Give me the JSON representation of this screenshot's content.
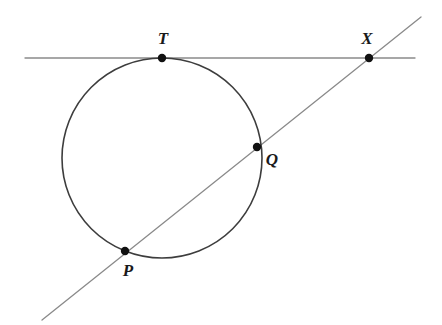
{
  "figure": {
    "width": 442,
    "height": 325,
    "background_color": "#ffffff"
  },
  "style": {
    "circle_stroke_color": "#3d3d3d",
    "circle_stroke_width": 1.6,
    "line_stroke_color": "#8a8a8a",
    "line_stroke_width": 1.3,
    "point_fill_color": "#111111",
    "point_radius": 4.2,
    "label_color": "#1a1a1a",
    "label_font_size": 17
  },
  "chart_data": {
    "type": "diagram",
    "shapes": {
      "circle": {
        "name": "circle",
        "center_x": 162,
        "center_y": 158,
        "radius": 100
      },
      "tangent_line": {
        "name": "tangent-line",
        "x1": 25,
        "y1": 58,
        "x2": 415,
        "y2": 58,
        "touches": "T"
      },
      "secant_line": {
        "name": "secant-line",
        "x1": 42,
        "y1": 320,
        "x2": 421,
        "y2": 17,
        "passes_through": "P, Q, X"
      }
    },
    "points": [
      {
        "label": "T",
        "x": 162,
        "y": 58,
        "label_x": 163,
        "label_y": 44,
        "role": "tangent-point"
      },
      {
        "label": "X",
        "x": 369,
        "y": 58,
        "label_x": 367,
        "label_y": 44,
        "role": "external-intersection"
      },
      {
        "label": "Q",
        "x": 257,
        "y": 147,
        "label_x": 272,
        "label_y": 165,
        "role": "near-secant-intersection"
      },
      {
        "label": "P",
        "x": 125,
        "y": 251,
        "label_x": 128,
        "label_y": 276,
        "role": "far-secant-intersection"
      }
    ]
  }
}
